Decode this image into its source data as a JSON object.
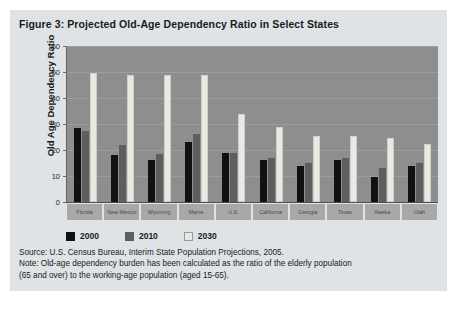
{
  "figure": {
    "title": "Figure 3: Projected Old-Age Dependency Ratio in Select States",
    "source": "Source: U.S. Census Bureau, Interim State Population Projections, 2005.",
    "note_line1": "Note: Old-age dependency burden has been calculated as the ratio of the elderly population",
    "note_line2": "(65 and over) to the working-age population (aged 15-65)."
  },
  "colors": {
    "panel_background": "#dfe3e6",
    "plot_background": "#8e8e8e",
    "gridline": "#9d9d9d",
    "series_2000": "#111111",
    "series_2010": "#5e5e5e",
    "series_2030": "#e9e9e4",
    "x_label_cell": "#a8a8a8",
    "text": "#1a1a1a"
  },
  "chart_data": {
    "type": "bar",
    "title": "Figure 3: Projected Old-Age Dependency Ratio in Select States",
    "xlabel": "",
    "ylabel": "Old Age Dependency Ratio",
    "ylim": [
      0,
      60
    ],
    "yticks": [
      0,
      10,
      20,
      30,
      40,
      50,
      60
    ],
    "grid": true,
    "legend_position": "bottom-left",
    "categories": [
      "Florida",
      "New Mexico",
      "Wyoming",
      "Maine",
      "U.S.",
      "California",
      "Georgia",
      "Texas",
      "Alaska",
      "Utah"
    ],
    "series": [
      {
        "name": "2000",
        "color": "#111111",
        "values": [
          28.5,
          18,
          16,
          23,
          19,
          16,
          14,
          16,
          9.5,
          14
        ]
      },
      {
        "name": "2010",
        "color": "#5e5e5e",
        "values": [
          27.5,
          22,
          18.5,
          26,
          19,
          17,
          15,
          17,
          13,
          15
        ]
      },
      {
        "name": "2030",
        "color": "#e9e9e4",
        "values": [
          49.5,
          49,
          49,
          49,
          34,
          29,
          25.5,
          25.5,
          24.5,
          22.5
        ]
      }
    ]
  }
}
